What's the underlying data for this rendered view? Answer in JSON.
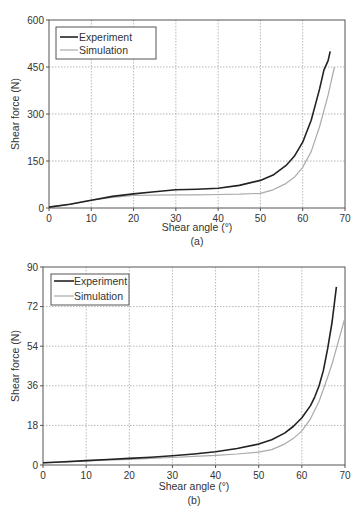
{
  "chart_data": [
    {
      "type": "line",
      "panel": "(a)",
      "xlabel": "Shear angle (°)",
      "ylabel": "Shear force (N)",
      "xlim": [
        0,
        70
      ],
      "ylim": [
        0,
        600
      ],
      "xticks": [
        0,
        10,
        20,
        30,
        40,
        50,
        60,
        70
      ],
      "yticks": [
        0,
        150,
        300,
        450,
        600
      ],
      "grid": true,
      "legend_position": "upper left",
      "series": [
        {
          "name": "Experiment",
          "color": "#222222",
          "x": [
            0,
            5,
            10,
            15,
            20,
            25,
            30,
            35,
            40,
            45,
            50,
            53,
            56,
            58,
            60,
            62,
            63,
            64,
            65,
            66,
            66.5
          ],
          "y": [
            3,
            12,
            25,
            37,
            45,
            52,
            58,
            60,
            63,
            72,
            88,
            105,
            135,
            165,
            210,
            280,
            330,
            380,
            440,
            470,
            500
          ]
        },
        {
          "name": "Simulation",
          "color": "#aaaaaa",
          "x": [
            0,
            5,
            10,
            15,
            20,
            25,
            30,
            35,
            40,
            45,
            50,
            53,
            56,
            58,
            60,
            62,
            64,
            66,
            67.5
          ],
          "y": [
            3,
            12,
            25,
            34,
            40,
            41,
            42,
            42,
            43,
            44,
            47,
            58,
            78,
            98,
            130,
            180,
            260,
            360,
            450
          ]
        }
      ]
    },
    {
      "type": "line",
      "panel": "(b)",
      "xlabel": "Shear angle (°)",
      "ylabel": "Shear force (N)",
      "xlim": [
        0,
        70
      ],
      "ylim": [
        0,
        90
      ],
      "xticks": [
        0,
        10,
        20,
        30,
        40,
        50,
        60,
        70
      ],
      "yticks": [
        0,
        18,
        36,
        54,
        72,
        90
      ],
      "grid": true,
      "legend_position": "upper left",
      "series": [
        {
          "name": "Experiment",
          "color": "#222222",
          "x": [
            0,
            5,
            10,
            15,
            20,
            25,
            30,
            35,
            40,
            45,
            50,
            53,
            56,
            58,
            60,
            62,
            63,
            64,
            65,
            66,
            67,
            68
          ],
          "y": [
            1,
            1.5,
            2,
            2.5,
            3,
            3.5,
            4.2,
            5,
            6,
            7.5,
            9.5,
            11.5,
            14.5,
            17.5,
            21.5,
            27,
            31,
            36,
            43,
            53,
            65,
            81
          ]
        },
        {
          "name": "Simulation",
          "color": "#aaaaaa",
          "x": [
            0,
            5,
            10,
            15,
            20,
            25,
            30,
            35,
            40,
            45,
            50,
            53,
            56,
            58,
            60,
            62,
            64,
            66,
            67,
            68,
            69,
            70
          ],
          "y": [
            1,
            1.3,
            1.8,
            2.2,
            2.6,
            3,
            3.4,
            3.9,
            4.4,
            5,
            5.8,
            7,
            9.5,
            12,
            15.5,
            21,
            29,
            40,
            46,
            53,
            60,
            67
          ]
        }
      ]
    }
  ],
  "legend": {
    "experiment_label": "Experiment",
    "simulation_label": "Simulation"
  },
  "labels": {
    "a": {
      "xlabel": "Shear angle (°)",
      "ylabel": "Shear force (N)",
      "panel": "(a)",
      "yticks": [
        "0",
        "150",
        "300",
        "450",
        "600"
      ],
      "xticks": [
        "0",
        "10",
        "20",
        "30",
        "40",
        "50",
        "60",
        "70"
      ]
    },
    "b": {
      "xlabel": "Shear angle (°)",
      "ylabel": "Shear force (N)",
      "panel": "(b)",
      "yticks": [
        "0",
        "18",
        "36",
        "54",
        "72",
        "90"
      ],
      "xticks": [
        "0",
        "10",
        "20",
        "30",
        "40",
        "50",
        "60",
        "70"
      ]
    }
  }
}
